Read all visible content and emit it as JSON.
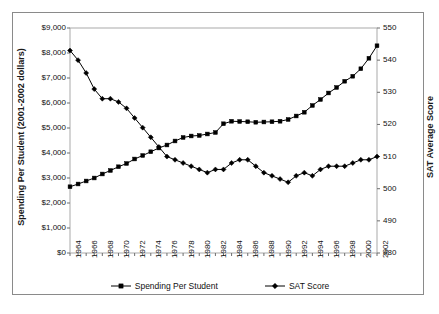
{
  "chart_data": {
    "type": "line",
    "title": "",
    "xlabel": "",
    "ylabel": "Spending Per Student (2001-2002 dollars)",
    "y2label": "SAT Average Score",
    "xlim": [
      1964,
      2002
    ],
    "ylim": [
      0,
      9000
    ],
    "y2lim": [
      480,
      550
    ],
    "grid": false,
    "legend_position": "bottom",
    "x": [
      1964,
      1965,
      1966,
      1967,
      1968,
      1969,
      1970,
      1971,
      1972,
      1973,
      1974,
      1975,
      1976,
      1977,
      1978,
      1979,
      1980,
      1981,
      1982,
      1983,
      1984,
      1985,
      1986,
      1987,
      1988,
      1989,
      1990,
      1991,
      1992,
      1993,
      1994,
      1995,
      1996,
      1997,
      1998,
      1999,
      2000,
      2001,
      2002
    ],
    "xtick_labels": [
      "1964",
      "1966",
      "1968",
      "1970",
      "1972",
      "1974",
      "1976",
      "1978",
      "1980",
      "1982",
      "1984",
      "1986",
      "1988",
      "1990",
      "1992",
      "1994",
      "1996",
      "1998",
      "2000",
      "2002"
    ],
    "ytick_labels": [
      "$0",
      "$1,000",
      "$2,000",
      "$3,000",
      "$4,000",
      "$5,000",
      "$6,000",
      "$7,000",
      "$8,000",
      "$9,000"
    ],
    "ytick_values": [
      0,
      1000,
      2000,
      3000,
      4000,
      5000,
      6000,
      7000,
      8000,
      9000
    ],
    "y2tick_labels": [
      "480",
      "490",
      "500",
      "510",
      "520",
      "530",
      "540",
      "550"
    ],
    "y2tick_values": [
      480,
      490,
      500,
      510,
      520,
      530,
      540,
      550
    ],
    "series": [
      {
        "name": "Spending Per Student",
        "axis": "left",
        "marker": "square",
        "color": "#000000",
        "values": [
          2650,
          2760,
          2880,
          3000,
          3160,
          3300,
          3450,
          3580,
          3760,
          3900,
          4050,
          4200,
          4320,
          4480,
          4620,
          4680,
          4700,
          4760,
          4820,
          5170,
          5270,
          5260,
          5250,
          5230,
          5240,
          5250,
          5270,
          5340,
          5480,
          5630,
          5900,
          6140,
          6400,
          6620,
          6870,
          7070,
          7370,
          7790,
          8290
        ]
      },
      {
        "name": "SAT Score",
        "axis": "right",
        "marker": "diamond",
        "color": "#000000",
        "values": [
          543,
          540,
          536,
          531,
          528,
          528,
          527,
          525,
          522,
          519,
          516,
          513,
          510,
          509,
          508,
          507,
          506,
          505,
          506,
          506,
          508,
          509,
          509,
          507,
          505,
          504,
          503,
          502,
          504,
          505,
          504,
          506,
          507,
          507,
          507,
          508,
          509,
          509,
          510
        ]
      }
    ],
    "legend": [
      {
        "label": "Spending Per Student",
        "marker": "square"
      },
      {
        "label": "SAT Score",
        "marker": "diamond"
      }
    ]
  }
}
